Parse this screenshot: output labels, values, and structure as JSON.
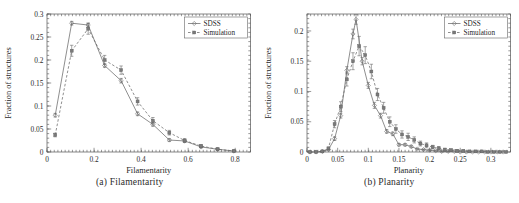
{
  "figure": {
    "panels": [
      {
        "caption": "(a) Filamentarity",
        "legend": [
          "SDSS",
          "Simulation"
        ]
      },
      {
        "caption": "(b) Planarity",
        "legend": [
          "SDSS",
          "Simulation"
        ]
      }
    ]
  },
  "chart_data": [
    {
      "type": "line",
      "title": "",
      "xlabel": "Filamentarity",
      "ylabel": "Fraction of structures",
      "xlim": [
        0,
        0.865
      ],
      "ylim": [
        0,
        0.3
      ],
      "xticks": [
        0,
        0.2,
        0.4,
        0.6,
        0.8
      ],
      "xticklabels": [
        "0",
        "0.2",
        "0.4",
        "0.6",
        "0.8"
      ],
      "yticks": [
        0,
        0.05,
        0.1,
        0.15,
        0.2,
        0.25,
        0.3
      ],
      "yticklabels": [
        "0",
        "0.05",
        "0.1",
        "0.15",
        "0.2",
        "0.25",
        "0.3"
      ],
      "grid": false,
      "legend_position": "top-right",
      "series": [
        {
          "name": "SDSS",
          "style": "solid",
          "marker": "diamond",
          "x": [
            0.035,
            0.105,
            0.175,
            0.245,
            0.315,
            0.385,
            0.45,
            0.52,
            0.585,
            0.655,
            0.725,
            0.795
          ],
          "values": [
            0.08,
            0.28,
            0.276,
            0.188,
            0.155,
            0.083,
            0.06,
            0.026,
            0.024,
            0.011,
            0.006,
            0.002
          ],
          "yerr": [
            0.004,
            0.004,
            0.004,
            0.004,
            0.005,
            0.004,
            0.004,
            0.003,
            0.003,
            0.002,
            0.002,
            0.001
          ]
        },
        {
          "name": "Simulation",
          "style": "dashed",
          "marker": "square",
          "x": [
            0.035,
            0.105,
            0.175,
            0.245,
            0.315,
            0.385,
            0.45,
            0.52,
            0.585,
            0.655,
            0.725,
            0.795
          ],
          "values": [
            0.037,
            0.22,
            0.268,
            0.2,
            0.178,
            0.11,
            0.068,
            0.042,
            0.025,
            0.013,
            0.006,
            0.002
          ],
          "yerr": [
            0.004,
            0.012,
            0.012,
            0.01,
            0.009,
            0.008,
            0.007,
            0.005,
            0.004,
            0.003,
            0.002,
            0.001
          ]
        }
      ]
    },
    {
      "type": "line",
      "title": "",
      "xlabel": "Planarity",
      "ylabel": "Fraction of structures",
      "xlim": [
        0,
        0.332
      ],
      "ylim": [
        0,
        0.228
      ],
      "xticks": [
        0,
        0.05,
        0.1,
        0.15,
        0.2,
        0.25,
        0.3
      ],
      "xticklabels": [
        "0",
        "0.05",
        "0.1",
        "0.15",
        "0.2",
        "0.25",
        "0.3"
      ],
      "yticks": [
        0,
        0.05,
        0.1,
        0.15,
        0.2
      ],
      "yticklabels": [
        "0",
        "0.05",
        "0.1",
        "0.15",
        "0.2"
      ],
      "grid": false,
      "legend_position": "top-right",
      "series": [
        {
          "name": "SDSS",
          "style": "solid",
          "marker": "diamond",
          "x": [
            0.005,
            0.015,
            0.025,
            0.035,
            0.045,
            0.055,
            0.065,
            0.075,
            0.08,
            0.09,
            0.1,
            0.11,
            0.12,
            0.13,
            0.14,
            0.15,
            0.16,
            0.17,
            0.18,
            0.19,
            0.2,
            0.21,
            0.22,
            0.23,
            0.24,
            0.25,
            0.26,
            0.27,
            0.28,
            0.29,
            0.3,
            0.31,
            0.32
          ],
          "values": [
            0.0,
            0.0,
            0.001,
            0.004,
            0.022,
            0.06,
            0.135,
            0.195,
            0.219,
            0.15,
            0.11,
            0.077,
            0.06,
            0.034,
            0.03,
            0.012,
            0.012,
            0.009,
            0.005,
            0.004,
            0.003,
            0.002,
            0.001,
            0.001,
            0.001,
            0.0,
            0.0,
            0.0,
            0.0,
            0.0,
            0.0,
            0.0,
            0.0
          ],
          "yerr": [
            0.0,
            0.0,
            0.001,
            0.001,
            0.003,
            0.004,
            0.006,
            0.008,
            0.008,
            0.006,
            0.005,
            0.005,
            0.004,
            0.003,
            0.003,
            0.002,
            0.002,
            0.002,
            0.001,
            0.001,
            0.001,
            0.001,
            0.001,
            0.001,
            0.0,
            0.0,
            0.0,
            0.0,
            0.0,
            0.0,
            0.0,
            0.0,
            0.0
          ],
          "peak_x": 0.08,
          "peak_y": 0.219
        },
        {
          "name": "Simulation",
          "style": "dashed",
          "marker": "square",
          "x": [
            0.005,
            0.015,
            0.025,
            0.035,
            0.045,
            0.055,
            0.065,
            0.075,
            0.085,
            0.095,
            0.105,
            0.115,
            0.125,
            0.135,
            0.145,
            0.155,
            0.165,
            0.175,
            0.185,
            0.195,
            0.205,
            0.215,
            0.225,
            0.235,
            0.245,
            0.255,
            0.265,
            0.275,
            0.285,
            0.295,
            0.305,
            0.315,
            0.325
          ],
          "values": [
            0.0,
            0.0,
            0.001,
            0.006,
            0.046,
            0.075,
            0.12,
            0.15,
            0.175,
            0.16,
            0.133,
            0.095,
            0.073,
            0.05,
            0.038,
            0.029,
            0.025,
            0.02,
            0.014,
            0.011,
            0.008,
            0.006,
            0.004,
            0.003,
            0.002,
            0.002,
            0.001,
            0.001,
            0.001,
            0.0,
            0.0,
            0.0,
            0.0
          ],
          "yerr": [
            0.0,
            0.0,
            0.001,
            0.002,
            0.006,
            0.008,
            0.011,
            0.014,
            0.016,
            0.014,
            0.012,
            0.01,
            0.009,
            0.008,
            0.007,
            0.006,
            0.006,
            0.005,
            0.004,
            0.004,
            0.003,
            0.003,
            0.002,
            0.002,
            0.002,
            0.001,
            0.001,
            0.001,
            0.001,
            0.0,
            0.0,
            0.0,
            0.0
          ],
          "peak_x": 0.085,
          "peak_y": 0.175
        }
      ]
    }
  ]
}
